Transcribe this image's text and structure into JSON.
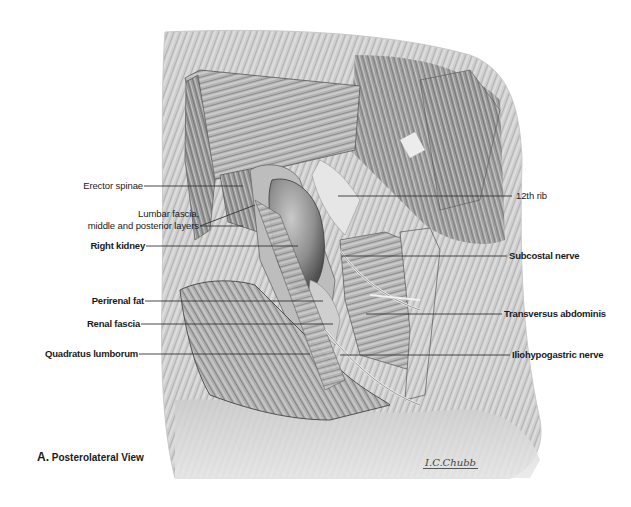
{
  "figure": {
    "caption_letter": "A.",
    "caption_text": "Posterolateral View",
    "signature": "I.C.Chubb",
    "palette": {
      "background": "#ffffff",
      "skin_light": "#e6e6e6",
      "muscle_mid": "#a8a8a8",
      "muscle_dark": "#6e6e6e",
      "kidney": "#9a9a9a",
      "leader_line": "#333333",
      "label_text": "#1a1a1a"
    }
  },
  "labels_left": [
    {
      "id": "erector-spinae",
      "text": "Erector spinae",
      "bold": false
    },
    {
      "id": "lumbar-fascia-1",
      "text": "Lumbar fascia,",
      "bold": false
    },
    {
      "id": "lumbar-fascia-2",
      "text": "middle and posterior layers",
      "bold": false
    },
    {
      "id": "right-kidney",
      "text": "Right kidney",
      "bold": true
    },
    {
      "id": "perirenal-fat",
      "text": "Perirenal fat",
      "bold": true
    },
    {
      "id": "renal-fascia",
      "text": "Renal fascia",
      "bold": true
    },
    {
      "id": "quadratus-lumborum",
      "text": "Quadratus lumborum",
      "bold": true
    }
  ],
  "labels_right": [
    {
      "id": "12th-rib",
      "text": "12th rib",
      "bold": false
    },
    {
      "id": "subcostal-nerve",
      "text": "Subcostal nerve",
      "bold": true
    },
    {
      "id": "transversus-abdominis",
      "text": "Transversus abdominis",
      "bold": true
    },
    {
      "id": "iliohypogastric-nerve",
      "text": "Iliohypogastric nerve",
      "bold": true
    }
  ]
}
